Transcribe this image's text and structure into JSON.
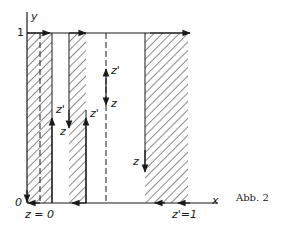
{
  "figure": {
    "caption": "Abb. 2",
    "axes": {
      "x_label": "x",
      "y_label": "y",
      "origin_label": "0",
      "y_tick_label": "1"
    },
    "bottom_labels": {
      "left": "z = 0",
      "right": "z'=1"
    },
    "flow_labels": {
      "strip1_up": "z'",
      "strip1_up_end": "z",
      "strip2_down": "z",
      "strip2_up": "z'",
      "center_up": "z'",
      "center_down": "z",
      "right_down": "z"
    },
    "colors": {
      "ink": "#1a1a1a",
      "background": "#ffffff"
    },
    "hatched_strips": [
      {
        "name": "strip-left",
        "x_from": 27,
        "x_to": 52
      },
      {
        "name": "strip-middle",
        "x_from": 69,
        "x_to": 86
      },
      {
        "name": "strip-right",
        "x_from": 145,
        "x_to": 188
      }
    ],
    "dashed_lines": [
      {
        "name": "dashed-left",
        "x": 40
      },
      {
        "name": "dashed-center",
        "x": 106
      }
    ]
  }
}
